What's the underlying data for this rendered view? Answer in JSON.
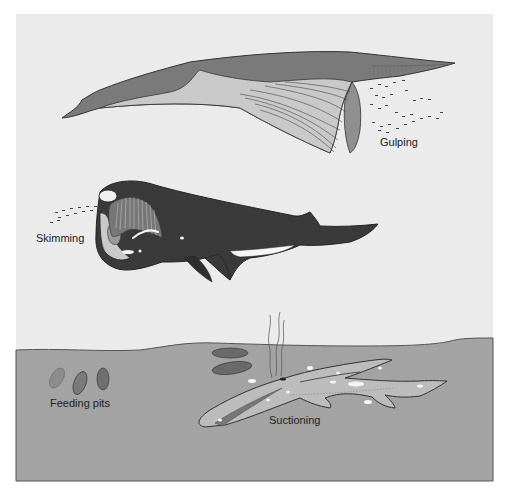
{
  "figure": {
    "colors": {
      "background": "#ebebeb",
      "seafloor": "#a3a3a3",
      "seafloor_edge": "#555555",
      "gulper_dark": "#7a7a7a",
      "gulper_light": "#c9c9c9",
      "skimmer": "#3a3a3a",
      "suction_whale": "#bcbcbc",
      "pit_light": "#8c8c8c",
      "pit_dark": "#6a6a6a"
    },
    "labels": {
      "gulping": "Gulping",
      "skimming": "Skimming",
      "feeding_pits": "Feeding pits",
      "suctioning": "Suctioning"
    }
  }
}
